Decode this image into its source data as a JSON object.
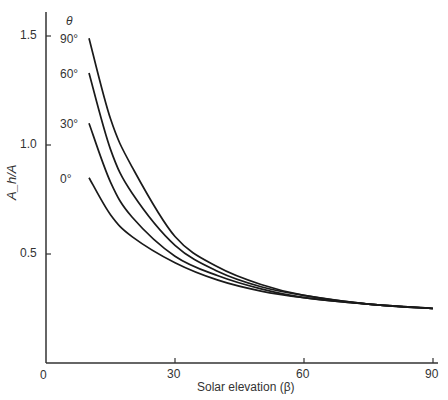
{
  "chart_data": {
    "type": "line",
    "title": "",
    "xlabel": "Solar elevation (β)",
    "ylabel": "A_h/A",
    "xlim": [
      0,
      90
    ],
    "ylim": [
      0,
      1.6
    ],
    "x_ticks": [
      "0",
      "30",
      "60",
      "90"
    ],
    "y_ticks": [
      "0.5",
      "1.0",
      "1.5"
    ],
    "origin_label": "0",
    "legend_title": "θ",
    "grid": false,
    "x": [
      10,
      15,
      20,
      30,
      40,
      50,
      60,
      75,
      90
    ],
    "series": [
      {
        "name": "90°",
        "values": [
          1.49,
          1.12,
          0.9,
          0.58,
          0.44,
          0.36,
          0.31,
          0.27,
          0.25
        ]
      },
      {
        "name": "60°",
        "values": [
          1.33,
          0.98,
          0.78,
          0.54,
          0.42,
          0.35,
          0.31,
          0.27,
          0.25
        ]
      },
      {
        "name": "30°",
        "values": [
          1.1,
          0.83,
          0.67,
          0.49,
          0.4,
          0.34,
          0.3,
          0.27,
          0.25
        ]
      },
      {
        "name": "0°",
        "values": [
          0.85,
          0.68,
          0.58,
          0.46,
          0.38,
          0.33,
          0.3,
          0.27,
          0.25
        ]
      }
    ]
  }
}
